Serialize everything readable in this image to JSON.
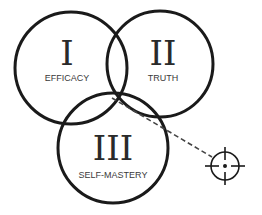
{
  "diagram": {
    "type": "venn",
    "circles": [
      {
        "numeral": "I",
        "label": "EFFICACY"
      },
      {
        "numeral": "II",
        "label": "TRUTH"
      },
      {
        "numeral": "III",
        "label": "SELF-MASTERY"
      }
    ],
    "target_icon": "crosshair-icon",
    "colors": {
      "stroke": "#1a1a1a",
      "text": "#2a2a2a",
      "background": "#ffffff"
    }
  }
}
